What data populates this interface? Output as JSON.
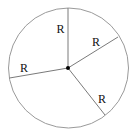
{
  "diagram": {
    "type": "circle-with-radii",
    "circle": {
      "cx": 68.5,
      "cy": 68,
      "r": 60,
      "stroke": "#9a9a9a"
    },
    "center_dot": {
      "cx": 68,
      "cy": 68,
      "r": 2,
      "fill": "#000000"
    },
    "radii": [
      {
        "name": "radius-top",
        "x2": 68,
        "y2": 8,
        "label": "R",
        "lx": 56.5,
        "ly": 33
      },
      {
        "name": "radius-upper-right",
        "x2": 118,
        "y2": 37,
        "label": "R",
        "lx": 92,
        "ly": 46
      },
      {
        "name": "radius-left",
        "x2": 9.5,
        "y2": 78,
        "label": "R",
        "lx": 20,
        "ly": 72
      },
      {
        "name": "radius-lower-right",
        "x2": 105,
        "y2": 115,
        "label": "R",
        "lx": 98,
        "ly": 103
      }
    ],
    "line_color": "#7a7a7a"
  }
}
